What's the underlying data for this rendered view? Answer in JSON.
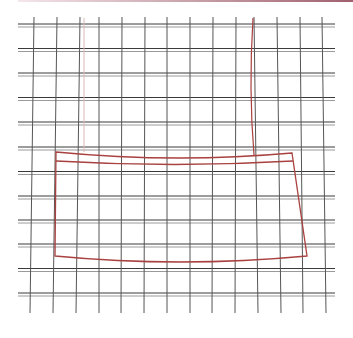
{
  "diagram": {
    "type": "pattern-grid",
    "width": 353,
    "height": 338,
    "colors": {
      "background": "#ffffff",
      "grid_dark": "#3a3a3a",
      "grid_light": "#9a9a9a",
      "pattern_red": "#a8413f",
      "pattern_red_faint": "#d9b8b8",
      "top_rule_start": "#f3e6ea",
      "top_rule_end": "#a0606e"
    },
    "grid": {
      "h_x_start": 18,
      "h_x_end": 335,
      "h_rows_y": [
        24,
        48.5,
        73,
        97.5,
        122,
        147,
        171.5,
        196,
        220,
        244,
        268.5,
        293
      ],
      "h_pair_offset": 3,
      "v_y_start": 17,
      "v_y_end": 313,
      "v_cols_top_x": [
        34,
        57,
        80,
        99,
        122,
        145,
        167,
        190,
        213,
        236,
        254,
        277,
        300,
        322
      ],
      "v_cols_bottom_x": [
        30,
        53,
        76,
        99,
        121,
        144,
        167,
        190,
        212,
        235,
        258,
        281,
        303,
        326
      ]
    },
    "pattern": {
      "outer_outline": {
        "top_left": [
          56,
          152
        ],
        "top_right": [
          292,
          153
        ],
        "top_mid_sag": [
          174,
          158
        ],
        "bottom_right": [
          307,
          256
        ],
        "bottom_left": [
          55,
          256
        ],
        "bottom_mid_sag": [
          180,
          262
        ]
      },
      "inner_band_line": {
        "left": [
          56,
          161
        ],
        "mid": [
          174,
          164.5
        ],
        "right": [
          293,
          161
        ]
      },
      "right_strap": {
        "top": [
          253,
          18
        ],
        "mid": [
          251,
          90
        ],
        "bottom": [
          254,
          155
        ]
      },
      "left_strap_faint": {
        "top": [
          84,
          18
        ],
        "bottom": [
          84,
          152
        ]
      }
    }
  }
}
